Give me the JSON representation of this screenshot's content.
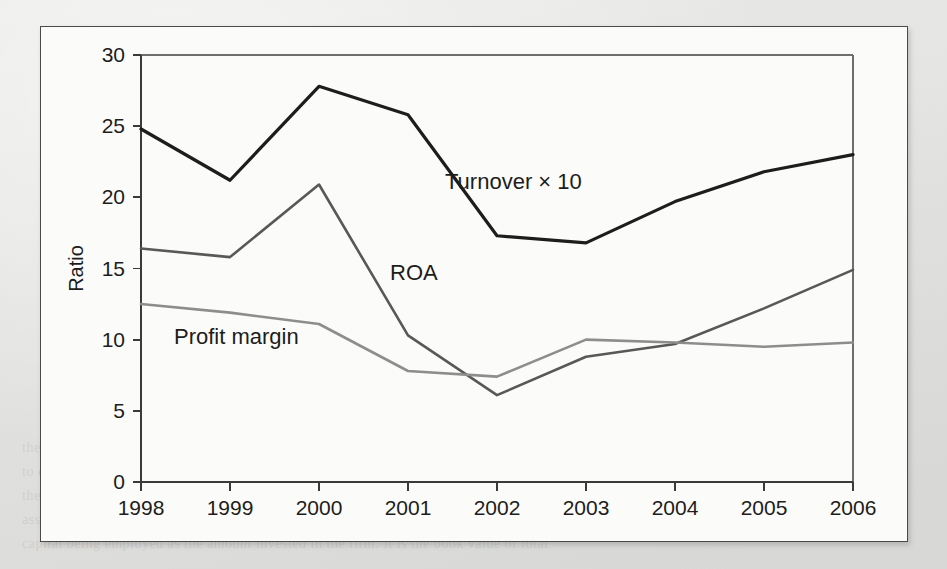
{
  "page": {
    "background_color": "#e4e4e2",
    "figure_background": "#fbfbfa",
    "border_color": "#4a4a48"
  },
  "ghost_text": [
    {
      "text": "Company Data Set",
      "x": 500,
      "y": 40,
      "size": 15
    },
    {
      "text": "Turnover",
      "x": 552,
      "y": 72,
      "size": 14
    },
    {
      "text": "(ratio)",
      "x": 562,
      "y": 102,
      "size": 14
    },
    {
      "text": "2.48",
      "x": 92,
      "y": 72,
      "size": 14
    },
    {
      "text": "2.12",
      "x": 92,
      "y": 104,
      "size": 14
    },
    {
      "text": "2.78",
      "x": 92,
      "y": 136,
      "size": 14
    },
    {
      "text": "2.58",
      "x": 92,
      "y": 168,
      "size": 14
    },
    {
      "text": "1.73",
      "x": 92,
      "y": 200,
      "size": 14
    },
    {
      "text": "(b)",
      "x": 430,
      "y": 196,
      "size": 14
    },
    {
      "text": "Flexible Budget",
      "x": 498,
      "y": 258,
      "size": 15
    },
    {
      "text": "1998",
      "x": 520,
      "y": 288,
      "size": 14
    },
    {
      "text": "8",
      "x": 62,
      "y": 72,
      "size": 15
    },
    {
      "text": "the firm had earned a higher return on assets, then the expected book than the expected",
      "x": 22,
      "y": 440,
      "size": 14
    },
    {
      "text": "to determine the proper liquidation value. In practice, it is especially difficult",
      "x": 22,
      "y": 464,
      "size": 14
    },
    {
      "text": "the purpose of the firm itself, the firm can determine the current ratio of 1.80 and",
      "x": 22,
      "y": 488,
      "size": 14
    },
    {
      "text": "assets in the total asset base that are measured by the value of the firm. The",
      "x": 22,
      "y": 512,
      "size": 14
    },
    {
      "text": "capital being employed as the amount invested in the firm. It is the book value of total",
      "x": 22,
      "y": 536,
      "size": 14
    }
  ],
  "chart_data": {
    "type": "line",
    "title": "",
    "xlabel": "",
    "ylabel": "Ratio",
    "categories": [
      "1998",
      "1999",
      "2000",
      "2001",
      "2002",
      "2003",
      "2004",
      "2005",
      "2006"
    ],
    "ylim": [
      0,
      30
    ],
    "yticks": [
      0,
      5,
      10,
      15,
      20,
      25,
      30
    ],
    "ytick_labels": [
      "0",
      "5",
      "10",
      "15",
      "20",
      "25",
      "30"
    ],
    "grid": false,
    "legend": "inline-annotations",
    "series": [
      {
        "name": "Turnover × 10",
        "color": "#1d1d1b",
        "width": 3.2,
        "values": [
          24.8,
          21.2,
          27.8,
          25.8,
          17.3,
          16.8,
          19.7,
          21.8,
          23.0
        ],
        "label_x": 2002,
        "label_value": 20.6,
        "label_dx": -52,
        "label_dy": 0
      },
      {
        "name": "ROA",
        "color": "#585856",
        "width": 2.6,
        "values": [
          16.4,
          15.8,
          20.9,
          10.3,
          6.1,
          8.8,
          9.7,
          12.2,
          14.9
        ],
        "label_x": 2001,
        "label_value": 14.2,
        "label_dx": -18,
        "label_dy": 0
      },
      {
        "name": "Profit margin",
        "color": "#8d8d8b",
        "width": 2.6,
        "values": [
          12.5,
          11.9,
          11.1,
          7.8,
          7.4,
          10.0,
          9.8,
          9.5,
          9.8
        ],
        "label_x": 1999,
        "label_value": 9.7,
        "label_dx": -56,
        "label_dy": 0
      }
    ]
  }
}
